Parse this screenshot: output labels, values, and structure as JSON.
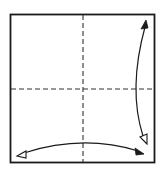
{
  "diagram": {
    "type": "origami-fold-diagram",
    "colors": {
      "background": "#ffffff",
      "stroke": "#1a1a1a"
    },
    "square": {
      "x": 10,
      "y": 14,
      "width": 145,
      "height": 148
    },
    "fold_lines": [
      {
        "name": "vertical-valley-fold",
        "style": "dashed",
        "x1": 83,
        "y1": 14,
        "x2": 83,
        "y2": 162
      },
      {
        "name": "horizontal-valley-fold",
        "style": "dashed",
        "x1": 10,
        "y1": 89,
        "x2": 155,
        "y2": 89
      }
    ],
    "arrows": [
      {
        "name": "vertical-fold-unfold-arrow",
        "filled_head": "top",
        "hollow_head": "bottom"
      },
      {
        "name": "horizontal-fold-unfold-arrow",
        "filled_head": "right",
        "hollow_head": "left"
      }
    ]
  }
}
